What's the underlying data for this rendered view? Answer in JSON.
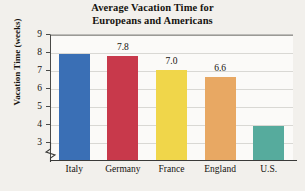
{
  "chart_data": {
    "type": "bar",
    "title": "Average Vacation Time for Europeans and Americans",
    "title_lines": [
      "Average Vacation Time for",
      "Europeans and Americans"
    ],
    "xlabel": "",
    "ylabel": "Vacation Time (weeks)",
    "ylim": [
      2.6,
      9
    ],
    "y_axis_break": true,
    "grid": true,
    "legend": "none",
    "categories": [
      "Italy",
      "Germany",
      "France",
      "England",
      "U.S."
    ],
    "values": [
      7.9,
      7.8,
      7.0,
      6.6,
      3.9
    ],
    "data_labels": [
      "",
      "7.8",
      "7.0",
      "6.6",
      ""
    ],
    "y_ticks": [
      "9",
      "8",
      "7",
      "6",
      "5",
      "4",
      "3"
    ],
    "bar_colors": [
      "#3a6fb5",
      "#c8394b",
      "#f0d64a",
      "#e8a863",
      "#56ab9d"
    ],
    "plot_background": "#fbfaf8",
    "page_background": "#f2f0ec",
    "gridline_color": "#d9d8d4",
    "axis_color": "#3a3a38"
  }
}
